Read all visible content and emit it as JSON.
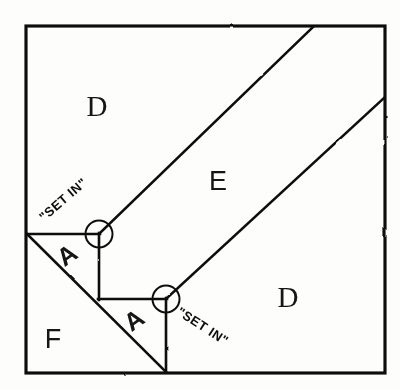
{
  "figure": {
    "style": "hand-drawn line drawing, black ink on white",
    "ink_color": "#111111",
    "background_color": "#fdfdfc",
    "outer_border": {
      "name": "outer-square",
      "left": 26,
      "top": 26,
      "right": 385,
      "bottom": 373,
      "stroke_width": 3.2
    },
    "regions": [
      {
        "id": "D-top",
        "label": "D",
        "label_x": 97,
        "label_y": 116,
        "font_class": "label-serif",
        "description": "upper-left background region above band E"
      },
      {
        "id": "E-band",
        "label": "E",
        "label_x": 218,
        "label_y": 190,
        "font_class": "label-sans",
        "description": "diagonal band running from lower-left to upper-right"
      },
      {
        "id": "D-right",
        "label": "D",
        "label_x": 288,
        "label_y": 307,
        "font_class": "label-serif",
        "description": "lower-right background region below band E"
      },
      {
        "id": "F-region",
        "label": "F",
        "label_x": 53,
        "label_y": 348,
        "font_class": "label-sans",
        "description": "lower-left triangular region below the long diagonal"
      },
      {
        "id": "A-upper",
        "label": "A",
        "label_x": 72,
        "label_y": 262,
        "rotation": -35,
        "font_class": "label-a",
        "description": "upper small triangle notch piece"
      },
      {
        "id": "A-lower",
        "label": "A",
        "label_x": 139,
        "label_y": 327,
        "rotation": -35,
        "font_class": "label-a",
        "description": "lower small triangle notch piece"
      }
    ],
    "annotations": [
      {
        "id": "set-in-upper",
        "text": "\"SET IN\"",
        "x": 44,
        "y": 222,
        "rotation": -41,
        "points_to_circle": "circle-upper",
        "description": "handwritten callout for the upper inside corner"
      },
      {
        "id": "set-in-lower",
        "text": "\"SET IN\"",
        "x": 176,
        "y": 314,
        "rotation": 33,
        "points_to_circle": "circle-lower",
        "description": "handwritten callout for the lower inside corner"
      }
    ],
    "markers": [
      {
        "id": "circle-upper",
        "name": "set-in-corner-marker-upper",
        "cx": 99,
        "cy": 234,
        "r": 13.5,
        "stroke_width": 2.0
      },
      {
        "id": "circle-lower",
        "name": "set-in-corner-marker-lower",
        "cx": 166,
        "cy": 299,
        "r": 13.5,
        "stroke_width": 2.0
      }
    ],
    "lines": [
      {
        "id": "band-edge-upper",
        "name": "band-e-upper-diagonal",
        "x1": 99,
        "y1": 234,
        "x2": 313,
        "y2": 27,
        "stroke_width": 2.6
      },
      {
        "id": "band-edge-lower",
        "name": "band-e-lower-diagonal",
        "x1": 166,
        "y1": 299,
        "x2": 384,
        "y2": 98,
        "stroke_width": 2.6
      },
      {
        "id": "notch-top-horizontal",
        "name": "notch-upper-horizontal-edge",
        "x1": 27,
        "y1": 234,
        "x2": 99,
        "y2": 234,
        "stroke_width": 2.6
      },
      {
        "id": "notch-vertical-upper",
        "name": "notch-upper-vertical-edge",
        "x1": 99,
        "y1": 234,
        "x2": 99,
        "y2": 299,
        "stroke_width": 2.6
      },
      {
        "id": "notch-mid-horizontal",
        "name": "notch-lower-horizontal-edge",
        "x1": 99,
        "y1": 299,
        "x2": 166,
        "y2": 299,
        "stroke_width": 2.6
      },
      {
        "id": "notch-vertical-lower",
        "name": "notch-lower-vertical-edge",
        "x1": 166,
        "y1": 299,
        "x2": 166,
        "y2": 372,
        "stroke_width": 2.6
      },
      {
        "id": "long-diagonal",
        "name": "bias-seam-long-diagonal",
        "x1": 27,
        "y1": 234,
        "x2": 166,
        "y2": 372,
        "stroke_width": 2.6
      }
    ]
  }
}
